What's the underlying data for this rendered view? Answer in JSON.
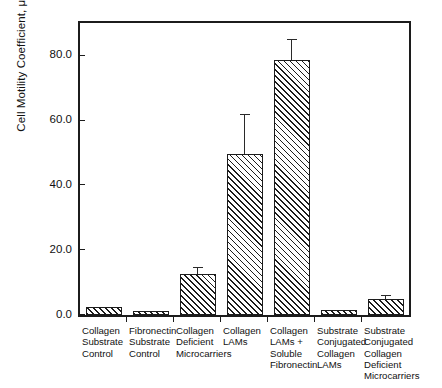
{
  "chart_data": {
    "type": "bar",
    "title": "",
    "subtitle": "",
    "xlabel": "",
    "ylabel": "Cell Motility Coefficient, μ, μm²/min",
    "ylabel_parts": {
      "before_sup": "Cell Motility Coefficient, μ, μm",
      "sup": "2",
      "after_sup": "/min"
    },
    "categories": [
      "Collagen\nSubstrate\nControl",
      "Fibronectin\nSubstrate\nControl",
      "Collagen\nDeficient\nMicrocarriers",
      "Collagen\nLAMs",
      "Collagen\nLAMs +\nSoluble\nFibronectin",
      "Substrate\nConjugated\nCollagen\nLAMs",
      "Substrate\nConjugated\nCollagen\nDeficient\nMicrocarriers"
    ],
    "values": [
      2.5,
      1.2,
      12.5,
      49.5,
      78.5,
      1.5,
      5.0
    ],
    "errors": [
      0,
      0,
      2.2,
      12.5,
      6.5,
      0,
      1.2
    ],
    "ylim": [
      0,
      90
    ],
    "yticks": [
      0,
      20,
      40,
      60,
      80
    ],
    "ytick_labels": [
      "0.0",
      "20.0",
      "40.0",
      "60.0",
      "80.0"
    ],
    "grid": false,
    "legend": false,
    "legend_position": "none",
    "bar_fill": "hatched-diagonal",
    "bar_edge_color": "#1c1c1c",
    "background_color": "#ffffff",
    "frame": "box"
  }
}
